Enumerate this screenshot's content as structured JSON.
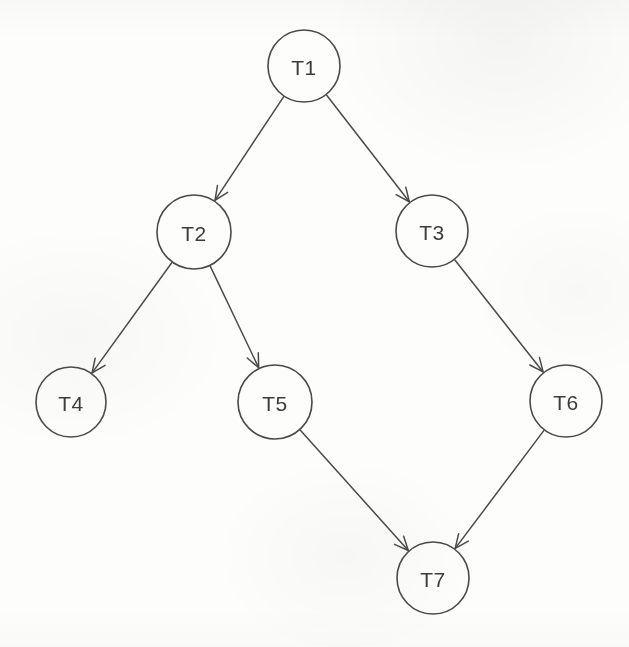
{
  "diagram": {
    "type": "directed-acyclic-graph",
    "background_color": "#fdfdfc",
    "stroke_color": "#4a4a4a",
    "label_color": "#3c3c3c",
    "node_radius": 36,
    "nodes": [
      {
        "id": "T1",
        "label": "T1",
        "cx": 304,
        "cy": 66,
        "r": 36
      },
      {
        "id": "T2",
        "label": "T2",
        "cx": 194,
        "cy": 232,
        "r": 37
      },
      {
        "id": "T3",
        "label": "T3",
        "cx": 432,
        "cy": 231,
        "r": 36
      },
      {
        "id": "T4",
        "label": "T4",
        "cx": 71,
        "cy": 402,
        "r": 35
      },
      {
        "id": "T5",
        "label": "T5",
        "cx": 275,
        "cy": 402,
        "r": 37
      },
      {
        "id": "T6",
        "label": "T6",
        "cx": 566,
        "cy": 401,
        "r": 36
      },
      {
        "id": "T7",
        "label": "T7",
        "cx": 433,
        "cy": 578,
        "r": 36
      }
    ],
    "edges": [
      {
        "from": "T1",
        "to": "T2",
        "directed": true
      },
      {
        "from": "T1",
        "to": "T3",
        "directed": true
      },
      {
        "from": "T2",
        "to": "T4",
        "directed": true
      },
      {
        "from": "T2",
        "to": "T5",
        "directed": true
      },
      {
        "from": "T3",
        "to": "T6",
        "directed": true
      },
      {
        "from": "T5",
        "to": "T7",
        "directed": true
      },
      {
        "from": "T6",
        "to": "T7",
        "directed": true
      }
    ]
  }
}
